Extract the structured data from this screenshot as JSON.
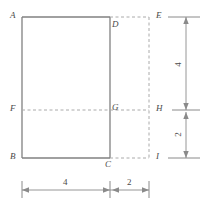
{
  "figure": {
    "type": "geometry-diagram",
    "vertex_labels": {
      "A": "A",
      "B": "B",
      "C": "C",
      "D": "D",
      "E": "E",
      "F": "F",
      "G": "G",
      "H": "H",
      "I": "I"
    },
    "dimensions": {
      "bottom_left": "4",
      "bottom_right": "2",
      "right_upper": "4",
      "right_lower": "2"
    },
    "colors": {
      "solid_line": "#808080",
      "dashed_line": "#a8a8a8",
      "dimension_line": "#8a8a8a",
      "label_text": "#4a4a4a",
      "background": "#ffffff"
    }
  }
}
